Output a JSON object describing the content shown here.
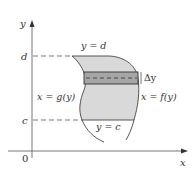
{
  "diagram": {
    "axes": {
      "x_label": "x",
      "y_label": "y",
      "origin_label": "0"
    },
    "levels": {
      "top_label": "d",
      "bottom_label": "c"
    },
    "curves": {
      "top_boundary": "y = d",
      "bottom_boundary": "y = c",
      "left_boundary": "x = g(y)",
      "right_boundary": "x = f(y)"
    },
    "strip": {
      "label": "Δy"
    },
    "colors": {
      "region_fill": "#d9d9d9",
      "strip_fill": "#a6a6a6",
      "axis": "#555555",
      "curve": "#444444",
      "text": "#333333"
    }
  }
}
